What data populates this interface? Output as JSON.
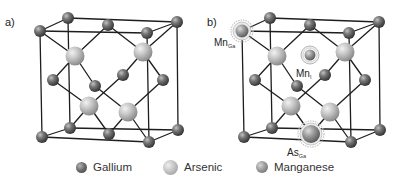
{
  "figure": {
    "panels": [
      {
        "id": "a",
        "label": "a)"
      },
      {
        "id": "b",
        "label": "b)"
      }
    ],
    "annotations": {
      "mn_ga": {
        "main": "Mn",
        "sub": "Ga"
      },
      "mn_i": {
        "main": "Mn",
        "sub": "I"
      },
      "as_ga": {
        "main": "As",
        "sub": "Ga"
      }
    },
    "legend": [
      {
        "key": "gallium",
        "label": "Gallium"
      },
      {
        "key": "arsenic",
        "label": "Arsenic"
      },
      {
        "key": "manganese",
        "label": "Manganese"
      }
    ],
    "colors": {
      "bond": "#1e1e1e",
      "gallium": "#6e6e6e",
      "arsenic": "#c4c4c4",
      "manganese": "#9a9a9a",
      "defect_halo": "#bdbdbd"
    }
  }
}
